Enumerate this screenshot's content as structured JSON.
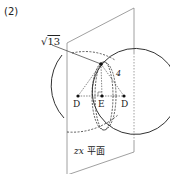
{
  "problem_number": "(2)",
  "labels": {
    "sqrt_prefix": "√",
    "sqrt_value": "13",
    "length_4": "4",
    "point_d_left": "D",
    "point_e": "E",
    "point_d_right": "D",
    "plane_var": "zx",
    "plane_text": "平面"
  },
  "colors": {
    "stroke": "#333333",
    "plane": "#888888",
    "background": "#ffffff"
  }
}
